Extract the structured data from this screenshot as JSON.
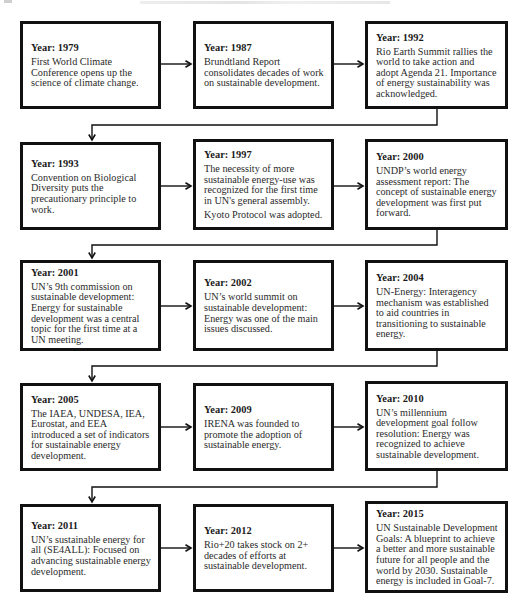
{
  "diagram": {
    "type": "timeline-flowchart",
    "flow": "left-to-right within rows, snaking down to the first box of the next row",
    "colors": {
      "border": "#111111",
      "background": "#ffffff",
      "text": "#222222"
    },
    "events": [
      {
        "year_label": "Year: 1979",
        "description": "First World Climate Conference opens up the science of climate change."
      },
      {
        "year_label": "Year: 1987",
        "description": "Brundtland Report consolidates decades of work on sustainable development."
      },
      {
        "year_label": "Year: 1992",
        "description": "Rio Earth Summit rallies the world to take action and adopt Agenda 21. Importance of energy sustainability was acknowledged."
      },
      {
        "year_label": "Year: 1993",
        "description": "Convention on Biological Diversity puts the precautionary principle to work."
      },
      {
        "year_label": "Year: 1997",
        "description": "The necessity of more sustainable energy-use was recognized for the first time in UN's general assembly.",
        "description_extra": "Kyoto Protocol was adopted."
      },
      {
        "year_label": "Year: 2000",
        "description": "UNDP’s world energy assessment report: The concept of sustainable energy development was first put forward."
      },
      {
        "year_label": "Year: 2001",
        "description": "UN’s 9th commission on sustainable development: Energy for sustainable development was a central topic for the first time at a UN meeting."
      },
      {
        "year_label": "Year: 2002",
        "description": "UN’s world summit on sustainable development: Energy was one of the main issues discussed."
      },
      {
        "year_label": "Year: 2004",
        "description": "UN-Energy: Interagency mechanism was established to aid countries in transitioning to sustainable energy."
      },
      {
        "year_label": "Year: 2005",
        "description": "The IAEA, UNDESA, IEA, Eurostat, and EEA introduced a set of indicators for sustainable energy development."
      },
      {
        "year_label": "Year: 2009",
        "description": "IRENA was founded to promote the adoption of sustainable energy."
      },
      {
        "year_label": "Year: 2010",
        "description": "UN’s millennium development goal follow resolution: Energy was recognized to achieve sustainable development."
      },
      {
        "year_label": "Year: 2011",
        "description": "UN’s sustainable energy for all (SE4ALL): Focused on advancing sustainable energy development."
      },
      {
        "year_label": "Year: 2012",
        "description": "Rio+20 takes stock on 2+ decades of efforts at sustainable development."
      },
      {
        "year_label": "Year: 2015",
        "description": "UN Sustainable Development Goals: A blueprint to achieve a better and more sustainable future for all people and the world by 2030. Sustainable energy is included in Goal-7."
      }
    ]
  }
}
